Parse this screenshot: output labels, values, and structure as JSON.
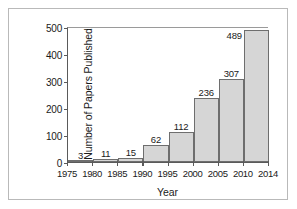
{
  "chart_data": {
    "type": "bar",
    "title": "",
    "xlabel": "Year",
    "ylabel": "Number of Papers Published",
    "categories": [
      "1975",
      "1980",
      "1985",
      "1990",
      "1995",
      "2000",
      "2005",
      "2010"
    ],
    "values": [
      3,
      11,
      15,
      62,
      112,
      236,
      307,
      489
    ],
    "data_labels": [
      "3",
      "11",
      "15",
      "62",
      "112",
      "236",
      "307",
      "489"
    ],
    "xlim": [
      1975,
      2014
    ],
    "ylim": [
      0,
      500
    ],
    "x_ticks": [
      "1975",
      "1980",
      "1985",
      "1990",
      "1995",
      "2000",
      "2005",
      "2010",
      "2014"
    ],
    "y_ticks": [
      "0",
      "100",
      "200",
      "300",
      "400",
      "500"
    ],
    "grid": false,
    "legend": "none",
    "bar_fill_color": "#d6d6d6",
    "bar_edge_color": "#6e6e6e",
    "axis_color": "#5a5a5a",
    "text_color": "#1a1a1a",
    "frame_color": "#b9b9b9",
    "background_color": "#ffffff"
  }
}
